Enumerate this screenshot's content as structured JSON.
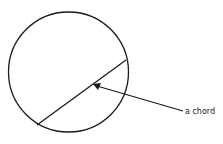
{
  "diagram": {
    "labels": {
      "chord": "a chord"
    },
    "circle": {
      "cx": 68.5,
      "cy": 72,
      "r": 60
    },
    "chord": {
      "x1": 37,
      "y1": 125,
      "x2": 126,
      "y2": 60
    },
    "arrow": {
      "x1": 183,
      "y1": 111,
      "x2": 94,
      "y2": 85
    },
    "colors": {
      "stroke": "#1a1a1a",
      "background": "#ffffff"
    }
  }
}
